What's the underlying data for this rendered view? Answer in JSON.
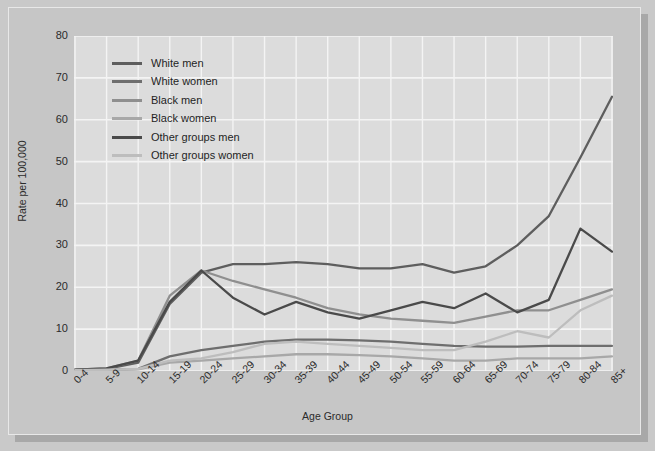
{
  "chart_data": {
    "type": "line",
    "title": "",
    "xlabel": "Age Group",
    "ylabel": "Rate per 100,000",
    "ylim": [
      0,
      80
    ],
    "ytick_step": 10,
    "yticks": [
      80,
      70,
      60,
      50,
      40,
      30,
      20,
      10,
      0
    ],
    "grid": true,
    "legend_position": "upper-left-inside",
    "categories": [
      "0-4",
      "5-9",
      "10-14",
      "15-19",
      "20-24",
      "25-29",
      "30-34",
      "35-39",
      "40-44",
      "45-49",
      "50-54",
      "55-59",
      "60-64",
      "65-69",
      "70-74",
      "75-79",
      "80-84",
      "85+"
    ],
    "series": [
      {
        "name": "White men",
        "color": "#5e5e5e",
        "values": [
          0.2,
          0.5,
          2.0,
          16.0,
          23.5,
          25.5,
          25.5,
          26.0,
          25.5,
          24.5,
          24.5,
          25.5,
          23.5,
          25.0,
          30.0,
          37.0,
          51.0,
          65.5
        ]
      },
      {
        "name": "White women",
        "color": "#6e6e6e",
        "values": [
          0.2,
          0.3,
          0.5,
          3.5,
          5.0,
          6.0,
          7.0,
          7.5,
          7.5,
          7.3,
          7.0,
          6.5,
          6.0,
          5.8,
          5.8,
          6.0,
          6.0,
          6.0
        ]
      },
      {
        "name": "Black men",
        "color": "#8f8f8f",
        "values": [
          0.3,
          0.6,
          2.5,
          18.0,
          24.0,
          21.5,
          19.5,
          17.5,
          15.0,
          13.5,
          12.5,
          12.0,
          11.5,
          13.0,
          14.5,
          14.5,
          17.0,
          19.5
        ]
      },
      {
        "name": "Black women",
        "color": "#a8a8a8",
        "values": [
          0.2,
          0.3,
          0.4,
          2.0,
          2.5,
          3.0,
          3.5,
          4.0,
          4.0,
          3.8,
          3.5,
          3.0,
          2.5,
          2.5,
          3.0,
          3.0,
          3.0,
          3.5
        ]
      },
      {
        "name": "Other groups men",
        "color": "#4a4a4a",
        "values": [
          0.3,
          0.6,
          2.5,
          16.5,
          24.0,
          17.5,
          13.5,
          16.5,
          14.0,
          12.5,
          14.5,
          16.5,
          15.0,
          18.5,
          14.0,
          17.0,
          34.0,
          28.5
        ]
      },
      {
        "name": "Other groups women",
        "color": "#bdbdbd",
        "values": [
          0.2,
          0.3,
          0.5,
          2.5,
          3.0,
          4.5,
          6.5,
          7.0,
          6.5,
          6.0,
          5.5,
          5.0,
          5.0,
          7.0,
          9.5,
          8.0,
          14.5,
          18.0
        ]
      }
    ]
  },
  "theme": {
    "page_background": "#c6c6c6",
    "plot_background": "#dcdcdc",
    "grid_color": "#f4f4f4",
    "axis_text_color": "#2b2b2b",
    "shadow_color": "#a8a8a8"
  }
}
